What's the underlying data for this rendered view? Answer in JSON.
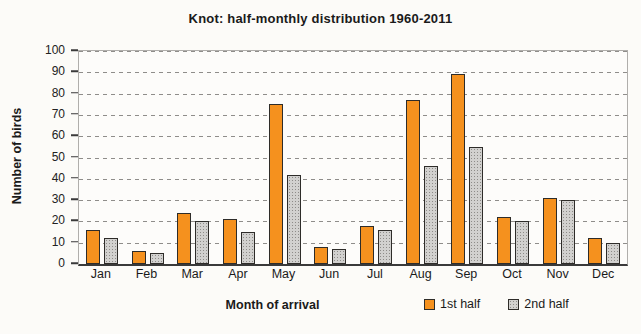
{
  "title": "Knot: half-monthly distribution 1960-2011",
  "chart_data": {
    "type": "bar",
    "title": "Knot: half-monthly distribution 1960-2011",
    "categories": [
      "Jan",
      "Feb",
      "Mar",
      "Apr",
      "May",
      "Jun",
      "Jul",
      "Aug",
      "Sep",
      "Oct",
      "Nov",
      "Dec"
    ],
    "series": [
      {
        "name": "1st half",
        "color": "#F5911E",
        "values": [
          16,
          6,
          24,
          21,
          75,
          8,
          18,
          77,
          89,
          22,
          31,
          12
        ]
      },
      {
        "name": "2nd half",
        "color": "#D2D1CF",
        "values": [
          12,
          5,
          20,
          15,
          42,
          7,
          16,
          46,
          55,
          20,
          30,
          10
        ]
      }
    ],
    "xlabel": "Month of arrival",
    "ylabel": "Number of birds",
    "ylim": [
      0,
      100
    ],
    "yticks": [
      0,
      10,
      20,
      30,
      40,
      50,
      60,
      70,
      80,
      90,
      100
    ],
    "grid": "horizontal-dashed",
    "legend_position": "bottom-right"
  },
  "colors": {
    "bar_border": "#2e2c29",
    "gridline": "#8f8d8a",
    "axis": "#3a3a3a",
    "background": "#fcfbf8"
  }
}
